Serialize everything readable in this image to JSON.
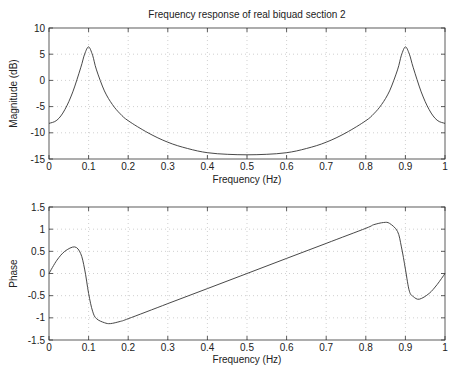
{
  "chart_data": [
    {
      "type": "line",
      "title": "Frequency response of real biquad section 2",
      "xlabel": "Frequency (Hz)",
      "ylabel": "Magnitude (dB)",
      "xlim": [
        0,
        1
      ],
      "ylim": [
        -15,
        10
      ],
      "xticks": [
        "0",
        "0.1",
        "0.2",
        "0.3",
        "0.4",
        "0.5",
        "0.6",
        "0.7",
        "0.8",
        "0.9",
        "1"
      ],
      "yticks": [
        "10",
        "5",
        "0",
        "-5",
        "-10",
        "-15"
      ],
      "grid": true,
      "x": [
        0,
        0.02,
        0.04,
        0.06,
        0.08,
        0.09,
        0.1,
        0.11,
        0.12,
        0.14,
        0.16,
        0.18,
        0.2,
        0.25,
        0.3,
        0.35,
        0.4,
        0.45,
        0.5,
        0.55,
        0.6,
        0.65,
        0.7,
        0.75,
        0.8,
        0.82,
        0.84,
        0.86,
        0.88,
        0.89,
        0.9,
        0.91,
        0.92,
        0.94,
        0.96,
        0.98,
        1.0
      ],
      "values": [
        -8.2,
        -7.6,
        -5.6,
        -2.2,
        2.4,
        5.0,
        6.4,
        4.8,
        2.0,
        -2.0,
        -4.6,
        -6.4,
        -7.7,
        -10.0,
        -11.8,
        -13.0,
        -13.8,
        -14.1,
        -14.2,
        -14.1,
        -13.8,
        -13.0,
        -11.8,
        -10.0,
        -7.7,
        -6.4,
        -4.6,
        -2.0,
        2.0,
        4.8,
        6.4,
        5.0,
        2.4,
        -2.2,
        -5.6,
        -7.6,
        -8.2
      ]
    },
    {
      "type": "line",
      "title": "",
      "xlabel": "Frequency (Hz)",
      "ylabel": "Phase",
      "xlim": [
        0,
        1
      ],
      "ylim": [
        -1.5,
        1.5
      ],
      "xticks": [
        "0",
        "0.1",
        "0.2",
        "0.3",
        "0.4",
        "0.5",
        "0.6",
        "0.7",
        "0.8",
        "0.9",
        "1"
      ],
      "yticks": [
        "1.5",
        "1",
        "0.5",
        "0",
        "-0.5",
        "-1",
        "-1.5"
      ],
      "grid": true,
      "x": [
        0,
        0.02,
        0.04,
        0.065,
        0.08,
        0.09,
        0.1,
        0.11,
        0.12,
        0.14,
        0.155,
        0.18,
        0.2,
        0.3,
        0.4,
        0.5,
        0.6,
        0.7,
        0.8,
        0.82,
        0.845,
        0.86,
        0.88,
        0.89,
        0.9,
        0.91,
        0.92,
        0.935,
        0.96,
        0.98,
        1.0
      ],
      "values": [
        0,
        0.3,
        0.5,
        0.6,
        0.45,
        0.1,
        -0.45,
        -0.85,
        -1.02,
        -1.11,
        -1.13,
        -1.08,
        -1.02,
        -0.68,
        -0.34,
        0,
        0.34,
        0.68,
        1.02,
        1.1,
        1.15,
        1.13,
        0.95,
        0.6,
        0.1,
        -0.4,
        -0.52,
        -0.58,
        -0.45,
        -0.25,
        0
      ]
    }
  ]
}
